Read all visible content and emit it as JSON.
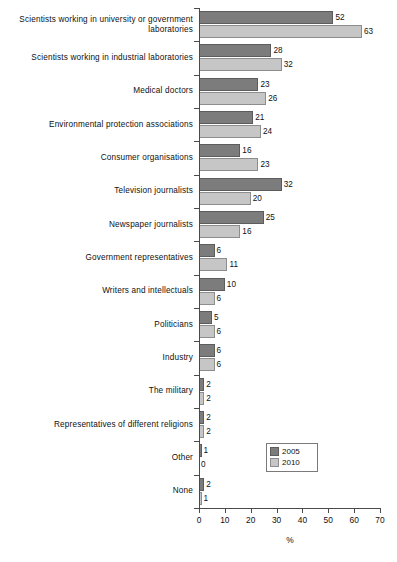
{
  "chart_data": {
    "type": "bar",
    "orientation": "horizontal",
    "title": "",
    "xlabel": "%",
    "ylabel": "",
    "xlim": [
      0,
      70
    ],
    "xticks": [
      0,
      10,
      20,
      30,
      40,
      50,
      60,
      70
    ],
    "grid": false,
    "legend_position": "lower-right",
    "categories": [
      "Scientists working in university or government laboratories",
      "Scientists working in industrial laboratories",
      "Medical doctors",
      "Environmental protection associations",
      "Consumer organisations",
      "Television journalists",
      "Newspaper journalists",
      "Government representatives",
      "Writers and intellectuals",
      "Politicians",
      "Industry",
      "The military",
      "Representatives of different religions",
      "Other",
      "None"
    ],
    "category_lines": [
      [
        "Scientists working in university or government",
        "laboratories"
      ],
      [
        "Scientists working in industrial laboratories"
      ],
      [
        "Medical doctors"
      ],
      [
        "Environmental protection associations"
      ],
      [
        "Consumer organisations"
      ],
      [
        "Television journalists"
      ],
      [
        "Newspaper journalists"
      ],
      [
        "Government representatives"
      ],
      [
        "Writers and intellectuals"
      ],
      [
        "Politicians"
      ],
      [
        "Industry"
      ],
      [
        "The military"
      ],
      [
        "Representatives of different religions"
      ],
      [
        "Other"
      ],
      [
        "None"
      ]
    ],
    "series": [
      {
        "name": "2005",
        "color": "#7c7c7c",
        "values": [
          52,
          28,
          23,
          21,
          16,
          32,
          25,
          6,
          10,
          5,
          6,
          2,
          2,
          1,
          2
        ]
      },
      {
        "name": "2010",
        "color": "#c6c6c6",
        "values": [
          63,
          32,
          26,
          24,
          23,
          20,
          16,
          11,
          6,
          6,
          6,
          2,
          2,
          0,
          1
        ]
      }
    ]
  },
  "legend": {
    "entries": [
      {
        "label": "2005"
      },
      {
        "label": "2010"
      }
    ]
  },
  "axis": {
    "x_title": "%",
    "tick_labels": [
      "0",
      "10",
      "20",
      "30",
      "40",
      "50",
      "60",
      "70"
    ]
  },
  "caption": ""
}
